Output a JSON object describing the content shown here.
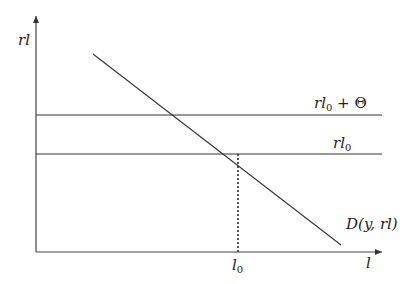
{
  "diagram": {
    "y_axis_label": "rl",
    "x_axis_label": "l",
    "upper_line_label": {
      "main": "rl",
      "sub": "0",
      "rest": " + Θ"
    },
    "lower_line_label": {
      "main": "rl",
      "sub": "0"
    },
    "x_tick_label": {
      "main": "l",
      "sub": "0"
    },
    "demand_curve_label": "D(y, rl)",
    "colors": {
      "line": "#333333",
      "text": "#222222",
      "background": "#ffffff"
    }
  }
}
